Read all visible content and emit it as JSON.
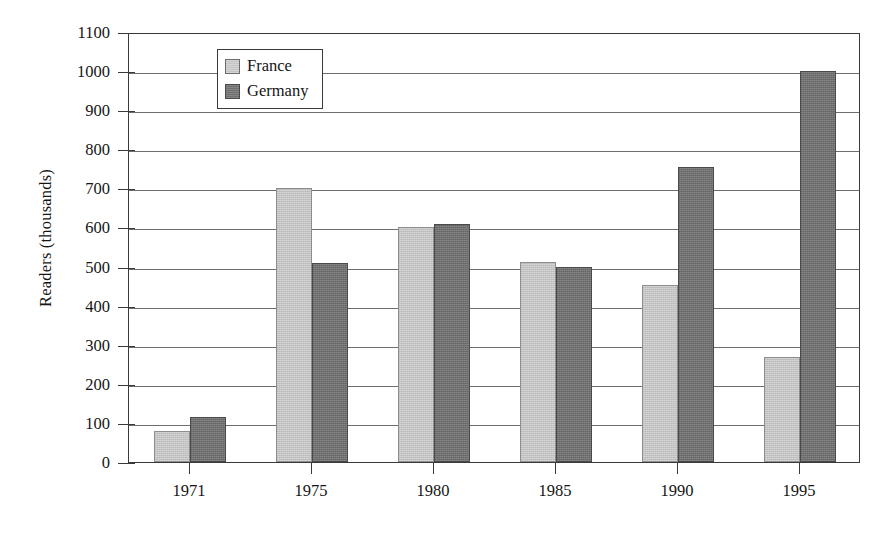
{
  "chart_data": {
    "type": "bar",
    "title": "",
    "subtitle": "",
    "xlabel": "",
    "ylabel": "Readers (thousands)",
    "categories": [
      "1971",
      "1975",
      "1980",
      "1985",
      "1990",
      "1995"
    ],
    "series": [
      {
        "name": "France",
        "color": "#c3c3c3",
        "values": [
          80,
          700,
          600,
          512,
          452,
          268
        ]
      },
      {
        "name": "Germany",
        "color": "#707070",
        "values": [
          115,
          510,
          610,
          500,
          755,
          1000
        ]
      }
    ],
    "ylim": [
      0,
      1100
    ],
    "ytick_values": [
      0,
      100,
      200,
      300,
      400,
      500,
      600,
      700,
      800,
      900,
      1000,
      1100
    ],
    "ytick_labels": [
      "0",
      "100",
      "200",
      "300",
      "400",
      "500",
      "600",
      "700",
      "800",
      "900",
      "1000",
      "1100"
    ],
    "grid": true,
    "grid_axis": "y",
    "legend_position": "upper-left-inside",
    "legend_entries": [
      "France",
      "Germany"
    ]
  }
}
